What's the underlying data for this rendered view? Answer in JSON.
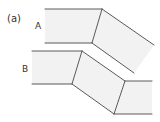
{
  "figure": {
    "panel_label": "(a)",
    "shapes": [
      {
        "label": "A",
        "description": "bent strip with one fold"
      },
      {
        "label": "B",
        "description": "bent strip with two folds"
      }
    ],
    "colors": {
      "fill": "#f2f2f2",
      "stroke": "#5a5a5a",
      "text": "#333333"
    }
  }
}
